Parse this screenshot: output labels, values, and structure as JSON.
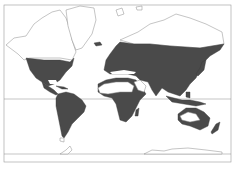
{
  "map": {
    "type": "world distribution map",
    "projection": "Mercator-like",
    "colors": {
      "shaded_region": "#4a4a4a",
      "unshaded_land": "#ffffff",
      "outline": "#8a8a8a",
      "background": "#ffffff"
    },
    "shaded_regions": [
      "North America (USA, Mexico, southern Canada)",
      "Central America & Caribbean",
      "South America",
      "Europe",
      "Africa (excluding Sahara)",
      "Madagascar",
      "Asia (Russia, China, India, Southeast Asia)",
      "Japan",
      "Indonesia & New Guinea",
      "Australia (coastal)",
      "New Zealand"
    ],
    "unshaded_regions": [
      "Arctic Canada",
      "Alaska",
      "Greenland",
      "Sahara",
      "Arabian Peninsula",
      "Central Australia",
      "Antarctica"
    ],
    "reference_lines": [
      "Equator"
    ]
  },
  "caption": {
    "text": ""
  }
}
